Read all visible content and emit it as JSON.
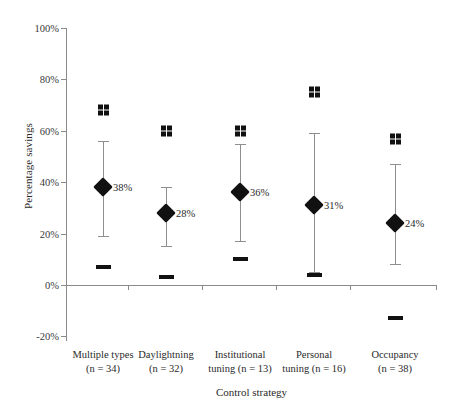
{
  "chart_data": {
    "type": "scatter",
    "title": "",
    "xlabel": "Control strategy",
    "ylabel": "Percentage savings",
    "ylim": [
      -20,
      100
    ],
    "yticks": [
      100,
      80,
      60,
      40,
      20,
      0,
      -20
    ],
    "ytick_labels": [
      "100%",
      "80%",
      "60%",
      "40%",
      "20%",
      "0%",
      "-20%"
    ],
    "grid": false,
    "legend": "none",
    "categories": [
      "Multiple types",
      "Daylightning",
      "Institutional tuning",
      "Personal tuning",
      "Occupancy"
    ],
    "category_labels": [
      {
        "name": "Multiple types",
        "n_text": "(n = 34)",
        "n": 34
      },
      {
        "name": "Daylightning",
        "n_text": "(n = 32)",
        "n": 32
      },
      {
        "name": "Institutional",
        "name2": "tuning (n = 13)",
        "n": 13
      },
      {
        "name": "Personal",
        "name2": "tuning (n = 16)",
        "n": 16
      },
      {
        "name": "Occupancy",
        "n_text": "(n = 38)",
        "n": 38
      }
    ],
    "series": [
      {
        "name": "Maximum",
        "marker": "grid-square",
        "values": [
          68,
          60,
          60,
          75,
          57
        ]
      },
      {
        "name": "Upper whisker",
        "marker": "errorbar-cap",
        "values": [
          56,
          38,
          55,
          59,
          47
        ]
      },
      {
        "name": "Mean",
        "marker": "diamond",
        "values": [
          38,
          28,
          36,
          31,
          24
        ]
      },
      {
        "name": "Lower whisker",
        "marker": "errorbar-cap",
        "values": [
          19,
          15,
          17,
          5,
          8
        ]
      },
      {
        "name": "Minimum",
        "marker": "dash",
        "values": [
          7,
          3,
          10,
          4,
          -13
        ]
      }
    ],
    "mean_labels": [
      "38%",
      "28%",
      "36%",
      "31%",
      "24%"
    ],
    "colors": {
      "marker": "#111111",
      "errorbar": "#8e8e8e",
      "axis": "#8a8a8a",
      "text": "#2a2a2a",
      "background": "#ffffff"
    }
  }
}
